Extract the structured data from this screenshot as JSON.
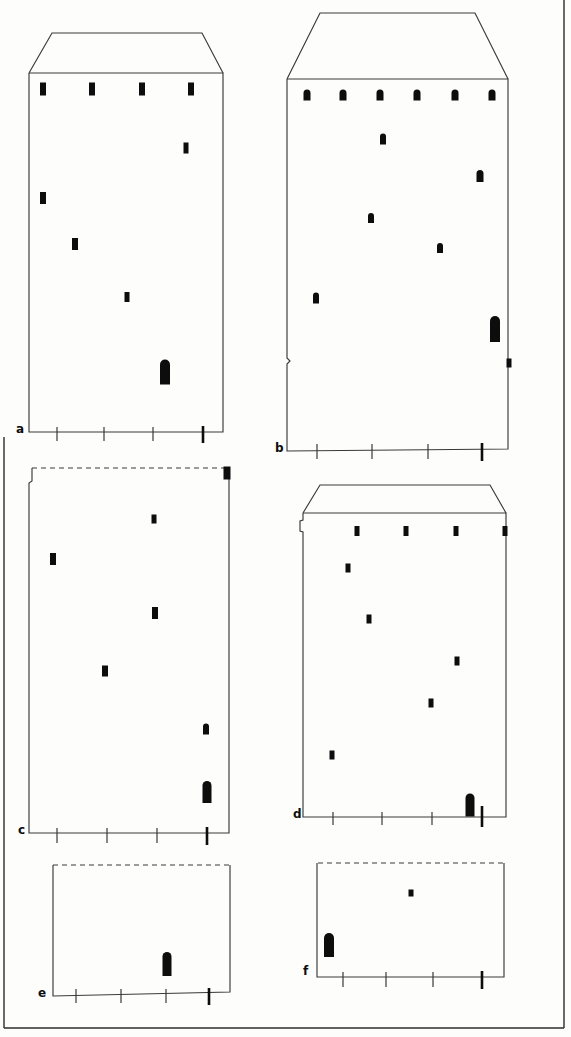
{
  "page": {
    "background": "#fdfdfc",
    "ink_color": "#3a3a38",
    "spot_color": "#0d0d0d",
    "frame_color": "#2c2c2a"
  },
  "figure": {
    "width": 571,
    "height": 1037,
    "frame_segments": [
      {
        "name": "frame-right",
        "points": [
          [
            564,
            0
          ],
          [
            564,
            1028
          ]
        ]
      },
      {
        "name": "frame-left",
        "points": [
          [
            4,
            437
          ],
          [
            4,
            1028
          ]
        ]
      },
      {
        "name": "frame-bottom",
        "points": [
          [
            4,
            1028
          ],
          [
            564,
            1028
          ]
        ]
      }
    ],
    "panels": [
      {
        "id": "a",
        "label": "a",
        "label_x": 16,
        "label_y": 433,
        "outline": [
          {
            "name": "roof",
            "dashed": false,
            "points": [
              [
                29,
                73
              ],
              [
                52,
                33
              ],
              [
                202,
                33
              ],
              [
                223,
                73
              ]
            ]
          },
          {
            "name": "body",
            "dashed": false,
            "points": [
              [
                29,
                73
              ],
              [
                223,
                73
              ],
              [
                223,
                432
              ],
              [
                29,
                432
              ],
              [
                29,
                73
              ]
            ]
          }
        ],
        "spots": [
          {
            "shape": "rect",
            "x": 43,
            "y": 89,
            "w": 6,
            "h": 13
          },
          {
            "shape": "rect",
            "x": 92,
            "y": 89,
            "w": 6,
            "h": 13
          },
          {
            "shape": "rect",
            "x": 142,
            "y": 89,
            "w": 6,
            "h": 13
          },
          {
            "shape": "rect",
            "x": 191,
            "y": 89,
            "w": 6,
            "h": 13
          },
          {
            "shape": "rect",
            "x": 186,
            "y": 148,
            "w": 5,
            "h": 11
          },
          {
            "shape": "rect",
            "x": 43,
            "y": 198,
            "w": 6,
            "h": 12
          },
          {
            "shape": "rect",
            "x": 75,
            "y": 244,
            "w": 6,
            "h": 12
          },
          {
            "shape": "rect",
            "x": 127,
            "y": 297,
            "w": 5,
            "h": 10
          },
          {
            "shape": "arch",
            "x": 165,
            "y": 372,
            "w": 10,
            "h": 25
          }
        ],
        "ticks": [
          {
            "x": 57,
            "y1": 427,
            "y2": 441,
            "bold": false
          },
          {
            "x": 104,
            "y1": 427,
            "y2": 441,
            "bold": false
          },
          {
            "x": 153,
            "y1": 427,
            "y2": 441,
            "bold": false
          },
          {
            "x": 203,
            "y1": 426,
            "y2": 443,
            "bold": true
          }
        ]
      },
      {
        "id": "b",
        "label": "b",
        "label_x": 275,
        "label_y": 452,
        "outline": [
          {
            "name": "roof",
            "dashed": false,
            "points": [
              [
                287,
                79
              ],
              [
                320,
                13
              ],
              [
                475,
                13
              ],
              [
                508,
                79
              ]
            ]
          },
          {
            "name": "body",
            "dashed": false,
            "points": [
              [
                287,
                79
              ],
              [
                287,
                358
              ],
              [
                290,
                361
              ],
              [
                287,
                364
              ],
              [
                287,
                451
              ],
              [
                508,
                449
              ],
              [
                508,
                79
              ],
              [
                287,
                79
              ]
            ]
          }
        ],
        "spots": [
          {
            "shape": "arch",
            "x": 307,
            "y": 95,
            "w": 7,
            "h": 11
          },
          {
            "shape": "arch",
            "x": 343,
            "y": 95,
            "w": 7,
            "h": 11
          },
          {
            "shape": "arch",
            "x": 380,
            "y": 95,
            "w": 7,
            "h": 11
          },
          {
            "shape": "arch",
            "x": 417,
            "y": 95,
            "w": 7,
            "h": 11
          },
          {
            "shape": "arch",
            "x": 455,
            "y": 95,
            "w": 7,
            "h": 11
          },
          {
            "shape": "arch",
            "x": 492,
            "y": 95,
            "w": 7,
            "h": 11
          },
          {
            "shape": "arch",
            "x": 383,
            "y": 139,
            "w": 6,
            "h": 11
          },
          {
            "shape": "arch",
            "x": 480,
            "y": 176,
            "w": 7,
            "h": 12
          },
          {
            "shape": "arch",
            "x": 371,
            "y": 218,
            "w": 6,
            "h": 10
          },
          {
            "shape": "arch",
            "x": 440,
            "y": 248,
            "w": 6,
            "h": 10
          },
          {
            "shape": "arch",
            "x": 316,
            "y": 298,
            "w": 6,
            "h": 11
          },
          {
            "shape": "arch",
            "x": 495,
            "y": 329,
            "w": 10,
            "h": 26
          },
          {
            "shape": "rect",
            "x": 509,
            "y": 363,
            "w": 5,
            "h": 9
          }
        ],
        "ticks": [
          {
            "x": 317,
            "y1": 444,
            "y2": 459,
            "bold": false
          },
          {
            "x": 372,
            "y1": 444,
            "y2": 459,
            "bold": false
          },
          {
            "x": 428,
            "y1": 444,
            "y2": 459,
            "bold": false
          },
          {
            "x": 482,
            "y1": 443,
            "y2": 461,
            "bold": true
          }
        ]
      },
      {
        "id": "c",
        "label": "c",
        "label_x": 18,
        "label_y": 834,
        "outline": [
          {
            "name": "solvent-front",
            "dashed": true,
            "points": [
              [
                32,
                468
              ],
              [
                228,
                468
              ]
            ]
          },
          {
            "name": "body",
            "dashed": false,
            "points": [
              [
                32,
                468
              ],
              [
                32,
                481
              ],
              [
                29,
                483
              ],
              [
                29,
                833
              ],
              [
                229,
                833
              ],
              [
                229,
                468
              ]
            ]
          }
        ],
        "spots": [
          {
            "shape": "rect",
            "x": 227,
            "y": 473,
            "w": 7,
            "h": 13
          },
          {
            "shape": "rect",
            "x": 154,
            "y": 519,
            "w": 5,
            "h": 9
          },
          {
            "shape": "rect",
            "x": 53,
            "y": 559,
            "w": 6,
            "h": 12
          },
          {
            "shape": "rect",
            "x": 155,
            "y": 613,
            "w": 6,
            "h": 12
          },
          {
            "shape": "rect",
            "x": 105,
            "y": 671,
            "w": 6,
            "h": 11
          },
          {
            "shape": "arch",
            "x": 206,
            "y": 729,
            "w": 6,
            "h": 11
          },
          {
            "shape": "arch",
            "x": 207,
            "y": 792,
            "w": 9,
            "h": 22
          }
        ],
        "ticks": [
          {
            "x": 57,
            "y1": 828,
            "y2": 843,
            "bold": false
          },
          {
            "x": 107,
            "y1": 828,
            "y2": 843,
            "bold": false
          },
          {
            "x": 157,
            "y1": 828,
            "y2": 843,
            "bold": false
          },
          {
            "x": 207,
            "y1": 827,
            "y2": 845,
            "bold": true
          }
        ]
      },
      {
        "id": "d",
        "label": "d",
        "label_x": 293,
        "label_y": 818,
        "outline": [
          {
            "name": "roof",
            "dashed": false,
            "points": [
              [
                303,
                513
              ],
              [
                320,
                485
              ],
              [
                490,
                485
              ],
              [
                506,
                513
              ]
            ]
          },
          {
            "name": "body",
            "dashed": false,
            "points": [
              [
                303,
                513
              ],
              [
                506,
                513
              ],
              [
                506,
                817
              ],
              [
                303,
                817
              ],
              [
                303,
                532
              ],
              [
                300,
                531
              ],
              [
                300,
                521
              ],
              [
                303,
                520
              ],
              [
                303,
                513
              ]
            ]
          }
        ],
        "spots": [
          {
            "shape": "rect",
            "x": 357,
            "y": 531,
            "w": 5,
            "h": 10
          },
          {
            "shape": "rect",
            "x": 406,
            "y": 531,
            "w": 5,
            "h": 10
          },
          {
            "shape": "rect",
            "x": 456,
            "y": 531,
            "w": 5,
            "h": 10
          },
          {
            "shape": "rect",
            "x": 505,
            "y": 531,
            "w": 5,
            "h": 10
          },
          {
            "shape": "rect",
            "x": 348,
            "y": 568,
            "w": 5,
            "h": 9
          },
          {
            "shape": "rect",
            "x": 369,
            "y": 619,
            "w": 5,
            "h": 9
          },
          {
            "shape": "rect",
            "x": 457,
            "y": 661,
            "w": 5,
            "h": 9
          },
          {
            "shape": "rect",
            "x": 431,
            "y": 703,
            "w": 5,
            "h": 9
          },
          {
            "shape": "rect",
            "x": 332,
            "y": 755,
            "w": 5,
            "h": 9
          },
          {
            "shape": "arch",
            "x": 470,
            "y": 805,
            "w": 9,
            "h": 23
          }
        ],
        "ticks": [
          {
            "x": 333,
            "y1": 812,
            "y2": 825,
            "bold": false
          },
          {
            "x": 382,
            "y1": 812,
            "y2": 825,
            "bold": false
          },
          {
            "x": 432,
            "y1": 812,
            "y2": 825,
            "bold": false
          },
          {
            "x": 482,
            "y1": 806,
            "y2": 827,
            "bold": true
          }
        ]
      },
      {
        "id": "e",
        "label": "e",
        "label_x": 38,
        "label_y": 997,
        "outline": [
          {
            "name": "solvent-front",
            "dashed": true,
            "points": [
              [
                53,
                865
              ],
              [
                230,
                865
              ]
            ]
          },
          {
            "name": "body",
            "dashed": false,
            "points": [
              [
                53,
                865
              ],
              [
                53,
                996
              ],
              [
                230,
                992
              ],
              [
                230,
                865
              ]
            ]
          }
        ],
        "spots": [
          {
            "shape": "arch",
            "x": 167,
            "y": 964,
            "w": 9,
            "h": 24
          }
        ],
        "ticks": [
          {
            "x": 76,
            "y1": 989,
            "y2": 1003,
            "bold": false
          },
          {
            "x": 121,
            "y1": 989,
            "y2": 1003,
            "bold": false
          },
          {
            "x": 166,
            "y1": 989,
            "y2": 1003,
            "bold": false
          },
          {
            "x": 209,
            "y1": 988,
            "y2": 1005,
            "bold": true
          }
        ]
      },
      {
        "id": "f",
        "label": "f",
        "label_x": 303,
        "label_y": 975,
        "outline": [
          {
            "name": "solvent-front",
            "dashed": true,
            "points": [
              [
                318,
                863
              ],
              [
                503,
                863
              ]
            ]
          },
          {
            "name": "body",
            "dashed": false,
            "points": [
              [
                317,
                863
              ],
              [
                317,
                977
              ],
              [
                504,
                977
              ],
              [
                504,
                863
              ]
            ]
          }
        ],
        "spots": [
          {
            "shape": "rect",
            "x": 411,
            "y": 893,
            "w": 5,
            "h": 7
          },
          {
            "shape": "arch",
            "x": 329,
            "y": 945,
            "w": 10,
            "h": 24
          }
        ],
        "ticks": [
          {
            "x": 343,
            "y1": 972,
            "y2": 987,
            "bold": false
          },
          {
            "x": 386,
            "y1": 972,
            "y2": 987,
            "bold": false
          },
          {
            "x": 433,
            "y1": 972,
            "y2": 987,
            "bold": false
          },
          {
            "x": 482,
            "y1": 971,
            "y2": 989,
            "bold": true
          }
        ]
      }
    ]
  }
}
